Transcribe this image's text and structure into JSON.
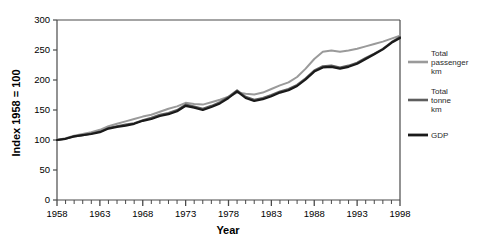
{
  "chart_data": {
    "type": "line",
    "title": "",
    "xlabel": "Year",
    "ylabel": "Index 1958 = 100",
    "xlim": [
      1958,
      1998
    ],
    "ylim": [
      0,
      300
    ],
    "grid": false,
    "legend_position": "right",
    "y_ticks": [
      0,
      50,
      100,
      150,
      200,
      250,
      300
    ],
    "y_tick_labels": [
      "0",
      "50",
      "100",
      "150",
      "200",
      "250",
      "300"
    ],
    "x_ticks": [
      1958,
      1963,
      1968,
      1973,
      1978,
      1983,
      1988,
      1993,
      1998
    ],
    "x_tick_labels": [
      "1958",
      "1963",
      "1968",
      "1973",
      "1978",
      "1983",
      "1988",
      "1993",
      "1998"
    ],
    "x_minor_tick_interval": 1,
    "x": [
      1958,
      1959,
      1960,
      1961,
      1962,
      1963,
      1964,
      1965,
      1966,
      1967,
      1968,
      1969,
      1970,
      1971,
      1972,
      1973,
      1974,
      1975,
      1976,
      1977,
      1978,
      1979,
      1980,
      1981,
      1982,
      1983,
      1984,
      1985,
      1986,
      1987,
      1988,
      1989,
      1990,
      1991,
      1992,
      1993,
      1994,
      1995,
      1996,
      1997,
      1998
    ],
    "series": [
      {
        "name": "Total passenger km",
        "label_lines": [
          "Total",
          "passenger",
          "km"
        ],
        "color": "#9a9a9a",
        "linewidth": 2.0,
        "values": [
          100,
          103,
          107,
          110,
          113,
          117,
          123,
          127,
          131,
          135,
          139,
          142,
          147,
          152,
          156,
          162,
          160,
          159,
          163,
          167,
          172,
          179,
          177,
          176,
          179,
          185,
          191,
          196,
          205,
          219,
          235,
          247,
          249,
          247,
          249,
          252,
          256,
          260,
          264,
          269,
          274
        ]
      },
      {
        "name": "Total tonne km",
        "label_lines": [
          "Total",
          "tonne",
          "km"
        ],
        "color": "#5e5e5e",
        "linewidth": 2.0,
        "values": [
          100,
          102,
          106,
          108,
          111,
          114,
          120,
          123,
          126,
          128,
          133,
          137,
          142,
          145,
          150,
          159,
          156,
          152,
          157,
          163,
          172,
          183,
          172,
          167,
          170,
          175,
          181,
          185,
          192,
          203,
          216,
          223,
          224,
          221,
          224,
          229,
          237,
          244,
          252,
          263,
          272
        ]
      },
      {
        "name": "GDP",
        "label_lines": [
          "GDP"
        ],
        "color": "#1a1a1a",
        "linewidth": 2.2,
        "values": [
          100,
          102,
          106,
          108,
          110,
          113,
          119,
          122,
          124,
          127,
          132,
          135,
          140,
          143,
          148,
          157,
          154,
          150,
          155,
          161,
          170,
          181,
          170,
          165,
          168,
          173,
          179,
          183,
          190,
          201,
          214,
          221,
          222,
          219,
          222,
          227,
          235,
          243,
          251,
          262,
          270
        ]
      }
    ]
  },
  "legend": {
    "items": [
      {
        "label": "Total passenger km",
        "color": "#9a9a9a"
      },
      {
        "label": "Total tonne km",
        "color": "#5e5e5e"
      },
      {
        "label": "GDP",
        "color": "#1a1a1a"
      }
    ]
  },
  "axes": {
    "y_title": "Index 1958 = 100",
    "x_title": "Year"
  }
}
